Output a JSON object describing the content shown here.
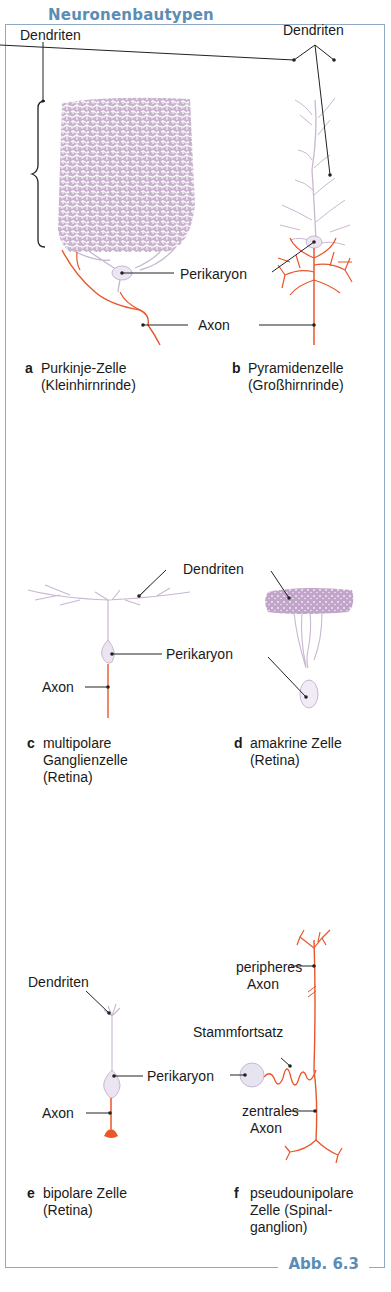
{
  "figure": {
    "title": "Neuronenbautypen",
    "caption": "Abb. 6.3",
    "colors": {
      "frame": "#8fa9c4",
      "title": "#5b8db5",
      "dendrite": "#c3aec8",
      "dendrite_dense": "#b99ac4",
      "axon": "#e8562a",
      "label_line": "#222222"
    }
  },
  "panels": [
    {
      "letter": "a",
      "name_line1": "Purkinje-Zelle",
      "name_line2": "(Kleinhirnrinde)",
      "labels": {
        "dendrites": "Dendriten",
        "perikaryon": "Perikaryon",
        "axon": "Axon"
      }
    },
    {
      "letter": "b",
      "name_line1": "Pyramidenzelle",
      "name_line2": "(Großhirnrinde)",
      "labels": {
        "dendrites": "Dendriten"
      }
    },
    {
      "letter": "c",
      "name_line1": "multipolare",
      "name_line2": "Ganglienzelle",
      "name_line3": "(Retina)",
      "labels": {
        "axon": "Axon"
      }
    },
    {
      "letter": "d",
      "name_line1": "amakrine Zelle",
      "name_line2": "(Retina)",
      "labels": {
        "dendrites": "Dendriten",
        "perikaryon": "Perikaryon"
      }
    },
    {
      "letter": "e",
      "name_line1": "bipolare Zelle",
      "name_line2": "(Retina)",
      "labels": {
        "dendrites": "Dendriten",
        "perikaryon": "Perikaryon",
        "axon": "Axon"
      }
    },
    {
      "letter": "f",
      "name_line1": "pseudounipolare",
      "name_line2": "Zelle (Spinal-",
      "name_line3": "ganglion)",
      "labels": {
        "peripheral_axon_1": "peripheres",
        "peripheral_axon_2": "Axon",
        "stem_process": "Stammfortsatz",
        "central_axon_1": "zentrales",
        "central_axon_2": "Axon"
      }
    }
  ]
}
